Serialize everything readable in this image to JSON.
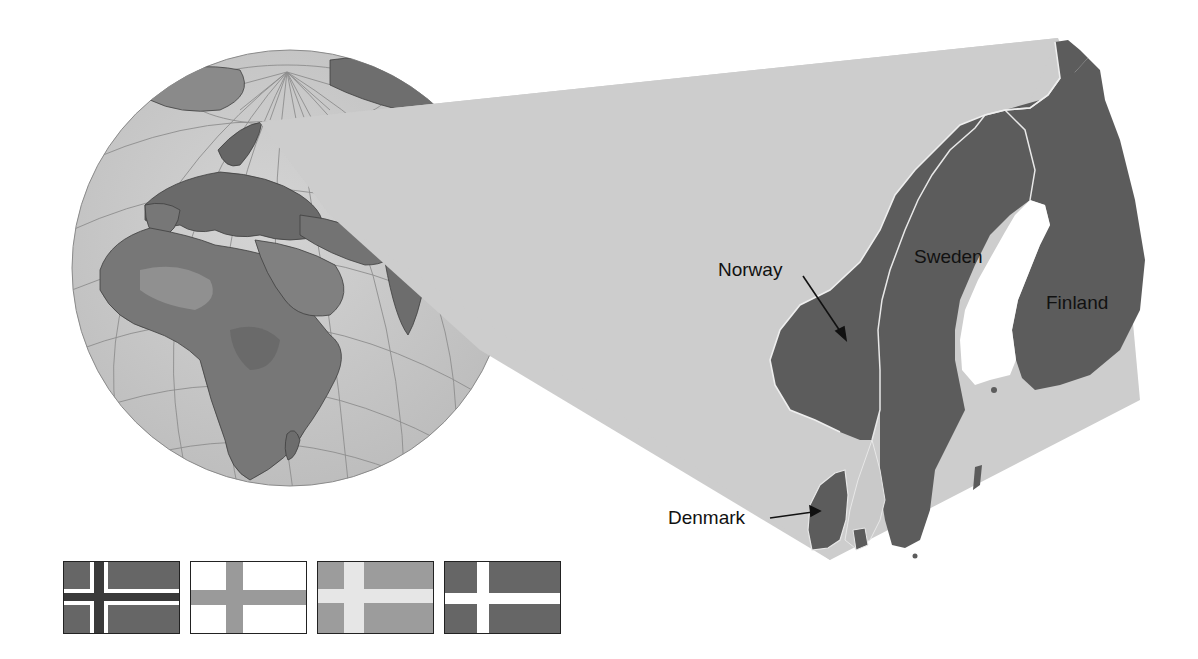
{
  "globe": {
    "description": "Orthographic globe centered on Africa and Europe with graticule",
    "highlight_region": "Scandinavia"
  },
  "inset": {
    "labels": {
      "norway": "Norway",
      "sweden": "Sweden",
      "finland": "Finland",
      "denmark": "Denmark"
    }
  },
  "colors": {
    "ocean_globe": "#c9c9c9",
    "land_dark": "#5f5f5f",
    "land_mid": "#8a8a8a",
    "cone": "#cdcdcd",
    "country_fill": "#5c5c5c",
    "border_line": "#e8e8e8",
    "label_text": "#111111"
  },
  "flags": [
    {
      "country": "Norway",
      "field": "#666666",
      "cross_outer": "#ffffff",
      "cross_inner": "#3a3a3a"
    },
    {
      "country": "Finland",
      "field": "#ffffff",
      "cross": "#9a9a9a"
    },
    {
      "country": "Sweden",
      "field": "#9c9c9c",
      "cross": "#e6e6e6"
    },
    {
      "country": "Denmark",
      "field": "#666666",
      "cross": "#ffffff"
    }
  ]
}
